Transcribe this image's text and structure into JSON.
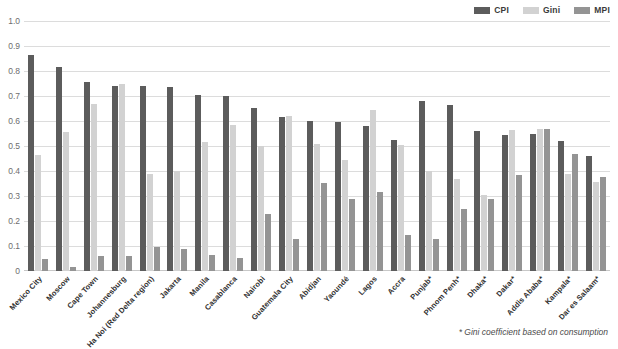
{
  "chart_data": {
    "type": "bar",
    "title": "",
    "subtitle": "",
    "xlabel": "",
    "ylabel": "",
    "ylim": [
      0,
      1.0
    ],
    "ytick_step": 0.1,
    "grid": true,
    "legend_position": "top-right",
    "categories": [
      "Mexico City",
      "Moscow",
      "Cape Town",
      "Johannesburg",
      "Ha Noi (Red Delta region)",
      "Jakarta",
      "Manila",
      "Casablanca",
      "Nairobi",
      "Guatemala City",
      "Abidjan",
      "Yaoundé",
      "Lagos",
      "Accra",
      "Punjab*",
      "Phnom Penh*",
      "Dhaka*",
      "Dakar*",
      "Addis Ababa*",
      "Kampala*",
      "Dar es Salaam*"
    ],
    "ytick_labels": [
      "0",
      "0.1",
      "0.2",
      "0.3",
      "0.4",
      "0.5",
      "0.6",
      "0.7",
      "0.8",
      "0.9",
      "1.0"
    ],
    "series": [
      {
        "name": "CPI",
        "color": "#5c5c5c",
        "values": [
          0.865,
          0.815,
          0.755,
          0.742,
          0.742,
          0.735,
          0.705,
          0.7,
          0.652,
          0.615,
          0.6,
          0.595,
          0.58,
          0.525,
          0.68,
          0.665,
          0.56,
          0.545,
          0.55,
          0.52,
          0.46
        ]
      },
      {
        "name": "Gini",
        "color": "#d2d2d2",
        "values": [
          0.465,
          0.558,
          0.668,
          0.75,
          0.39,
          0.4,
          0.516,
          0.586,
          0.5,
          0.62,
          0.51,
          0.444,
          0.645,
          0.505,
          0.4,
          0.37,
          0.305,
          0.565,
          0.57,
          0.39,
          0.355
        ]
      },
      {
        "name": "MPI",
        "color": "#949494",
        "values": [
          0.05,
          0.017,
          0.06,
          0.06,
          0.097,
          0.087,
          0.066,
          0.052,
          0.23,
          0.128,
          0.353,
          0.29,
          0.315,
          0.145,
          0.128,
          0.25,
          0.29,
          0.385,
          0.57,
          0.47,
          0.375
        ]
      }
    ],
    "footnote": "* Gini coefficient based on consumption"
  }
}
